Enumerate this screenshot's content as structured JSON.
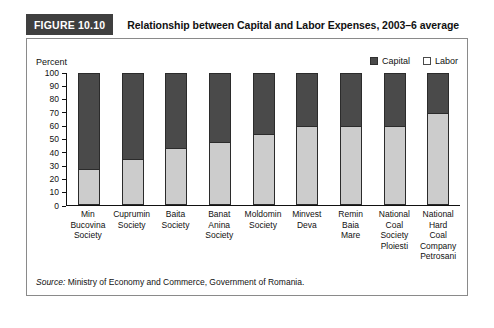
{
  "figure": {
    "number_label": "FIGURE 10.10",
    "title": "Relationship between Capital and Labor Expenses, 2003–6 average",
    "source_word": "Source:",
    "source_text": " Ministry of Economy and Commerce, Government of Romania.",
    "axis_unit_label": "Percent"
  },
  "colors": {
    "capital": "#4a4a4a",
    "labor": "#cccccc",
    "tab_background": "#3f3f3f",
    "tab_text": "#ffffff",
    "box_border": "#8a8a8a",
    "axis": "#111111",
    "page_background": "#ffffff"
  },
  "legend": {
    "position": "top-right",
    "items": [
      {
        "label": "Capital",
        "swatch": "capital-swatch"
      },
      {
        "label": "Labor",
        "swatch": "labor-swatch"
      }
    ]
  },
  "chart_data": {
    "type": "bar",
    "stacked": true,
    "title": "Relationship between Capital and Labor Expenses, 2003–6 average",
    "xlabel": "",
    "ylabel": "Percent",
    "ylim": [
      0,
      100
    ],
    "yticks": [
      0,
      10,
      20,
      30,
      40,
      50,
      60,
      70,
      80,
      90,
      100
    ],
    "ytick_labels": [
      "0",
      "10",
      "20",
      "30",
      "40",
      "50",
      "60",
      "70",
      "80",
      "90",
      "100"
    ],
    "grid": false,
    "legend_position": "top-right",
    "categories": [
      "Min Bucovina Society",
      "Cuprumin Society",
      "Baita Society",
      "Banat Anina Society",
      "Moldomin Society",
      "Minvest Deva",
      "Remin Baia Mare",
      "National Coal Society Ploiesti",
      "National Hard Coal Company Petrosani"
    ],
    "category_lines": [
      [
        "Min",
        "Bucovina",
        "Society"
      ],
      [
        "Cuprumin",
        "Society"
      ],
      [
        "Baita",
        "Society"
      ],
      [
        "Banat",
        "Anina",
        "Society"
      ],
      [
        "Moldomin",
        "Society"
      ],
      [
        "Minvest",
        "Deva"
      ],
      [
        "Remin",
        "Baia",
        "Mare"
      ],
      [
        "National",
        "Coal",
        "Society",
        "Ploiesti"
      ],
      [
        "National",
        "Hard",
        "Coal",
        "Company",
        "Petrosani"
      ]
    ],
    "series": [
      {
        "name": "Labor",
        "values": [
          27,
          35,
          43,
          48,
          54,
          60,
          60,
          60,
          70
        ]
      },
      {
        "name": "Capital",
        "values": [
          73,
          65,
          57,
          52,
          46,
          40,
          40,
          40,
          30
        ]
      }
    ]
  }
}
